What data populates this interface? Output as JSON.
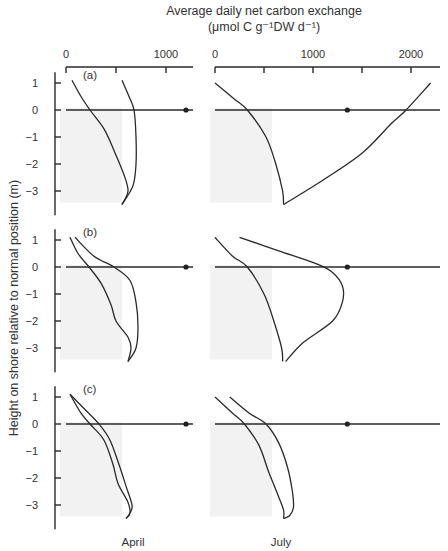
{
  "title": {
    "line1": "Average daily net carbon exchange",
    "line2": "(μmol C g⁻¹DW d⁻¹)"
  },
  "ylabel": "Height on shore relative to normal position (m)",
  "columns": [
    {
      "label": "April",
      "ticks": [
        "0",
        "1000"
      ]
    },
    {
      "label": "July",
      "ticks": [
        "0",
        "1000",
        "2000"
      ]
    }
  ],
  "panels": [
    "(a)",
    "(b)",
    "(c)"
  ],
  "yticks": [
    "1",
    "0",
    "−1",
    "−2",
    "−3"
  ],
  "chart_data": {
    "type": "line",
    "xlabel": "Average daily net carbon exchange (μmol C g⁻¹DW d⁻¹)",
    "ylabel": "Height on shore relative to normal position (m)",
    "grid": false,
    "layout": "3 rows (a,b,c) x 2 columns (April, July); each panel shows two envelope curves vs height; marker dot on zero line",
    "columns": {
      "April": {
        "xlim": [
          0,
          1250
        ],
        "xticks": [
          0,
          500,
          1000
        ],
        "xtick_labels": [
          "0",
          "",
          "1000"
        ]
      },
      "July": {
        "xlim": [
          0,
          2300
        ],
        "xticks": [
          0,
          500,
          1000,
          1500,
          2000
        ],
        "xtick_labels": [
          "0",
          "",
          "1000",
          "",
          "2000"
        ]
      }
    },
    "ylim": [
      -3.6,
      1.5
    ],
    "yticks": [
      1,
      0,
      -1,
      -2,
      -3
    ],
    "panels": [
      {
        "label": "(a)",
        "April": {
          "inner": [
            [
              60,
              1.1
            ],
            [
              150,
              0.5
            ],
            [
              240,
              0
            ],
            [
              380,
              -0.7
            ],
            [
              480,
              -1.5
            ],
            [
              580,
              -2.4
            ],
            [
              620,
              -3
            ],
            [
              560,
              -3.5
            ]
          ],
          "outer": [
            [
              560,
              1.1
            ],
            [
              630,
              0.5
            ],
            [
              680,
              0
            ],
            [
              700,
              -1
            ],
            [
              700,
              -2
            ],
            [
              670,
              -2.8
            ],
            [
              560,
              -3.5
            ]
          ],
          "marker": [
            1200,
            0
          ]
        },
        "July": {
          "inner": [
            [
              0,
              1.0
            ],
            [
              200,
              0.4
            ],
            [
              330,
              0
            ],
            [
              520,
              -1
            ],
            [
              620,
              -2
            ],
            [
              690,
              -3
            ],
            [
              700,
              -3.5
            ]
          ],
          "outer": [
            [
              700,
              -3.5
            ],
            [
              1100,
              -2.6
            ],
            [
              1500,
              -1.6
            ],
            [
              1800,
              -0.5
            ],
            [
              1950,
              0
            ],
            [
              2200,
              1.0
            ]
          ],
          "marker": [
            1350,
            0
          ]
        }
      },
      {
        "label": "(b)",
        "April": {
          "inner": [
            [
              40,
              1.1
            ],
            [
              120,
              0.5
            ],
            [
              230,
              0
            ],
            [
              350,
              -0.6
            ],
            [
              450,
              -1.4
            ],
            [
              500,
              -2
            ],
            [
              620,
              -2.6
            ],
            [
              650,
              -3
            ],
            [
              620,
              -3.5
            ]
          ],
          "outer": [
            [
              90,
              1.1
            ],
            [
              280,
              0.4
            ],
            [
              480,
              0
            ],
            [
              640,
              -0.5
            ],
            [
              700,
              -1.3
            ],
            [
              720,
              -2.2
            ],
            [
              700,
              -3
            ],
            [
              620,
              -3.5
            ]
          ],
          "marker": [
            1200,
            0
          ]
        },
        "July": {
          "inner": [
            [
              0,
              1.1
            ],
            [
              180,
              0.4
            ],
            [
              330,
              0
            ],
            [
              500,
              -1
            ],
            [
              600,
              -2
            ],
            [
              680,
              -3
            ],
            [
              690,
              -3.5
            ]
          ],
          "outer": [
            [
              250,
              1.1
            ],
            [
              650,
              0.6
            ],
            [
              1050,
              0.1
            ],
            [
              1200,
              -0.2
            ],
            [
              1300,
              -0.7
            ],
            [
              1300,
              -1.3
            ],
            [
              1200,
              -2
            ],
            [
              900,
              -2.8
            ],
            [
              720,
              -3.5
            ]
          ],
          "marker": [
            1350,
            0
          ]
        }
      },
      {
        "label": "(c)",
        "April": {
          "inner": [
            [
              40,
              1.1
            ],
            [
              150,
              0.4
            ],
            [
              240,
              0
            ],
            [
              380,
              -0.6
            ],
            [
              470,
              -1.5
            ],
            [
              520,
              -2.2
            ],
            [
              620,
              -2.9
            ],
            [
              640,
              -3.3
            ],
            [
              600,
              -3.5
            ]
          ],
          "outer": [
            [
              40,
              1.1
            ],
            [
              200,
              0.5
            ],
            [
              330,
              0
            ],
            [
              440,
              -0.6
            ],
            [
              530,
              -1.5
            ],
            [
              600,
              -2.3
            ],
            [
              660,
              -3
            ],
            [
              640,
              -3.3
            ],
            [
              600,
              -3.5
            ]
          ],
          "marker": [
            1200,
            0
          ]
        },
        "July": {
          "inner": [
            [
              0,
              1.0
            ],
            [
              180,
              0.4
            ],
            [
              300,
              0
            ],
            [
              450,
              -0.8
            ],
            [
              550,
              -1.8
            ],
            [
              650,
              -2.7
            ],
            [
              700,
              -3.2
            ],
            [
              700,
              -3.5
            ]
          ],
          "outer": [
            [
              150,
              1.0
            ],
            [
              350,
              0.4
            ],
            [
              520,
              0
            ],
            [
              650,
              -0.7
            ],
            [
              740,
              -1.6
            ],
            [
              790,
              -2.5
            ],
            [
              800,
              -3.1
            ],
            [
              760,
              -3.4
            ],
            [
              700,
              -3.5
            ]
          ],
          "marker": [
            1350,
            0
          ]
        }
      }
    ]
  }
}
